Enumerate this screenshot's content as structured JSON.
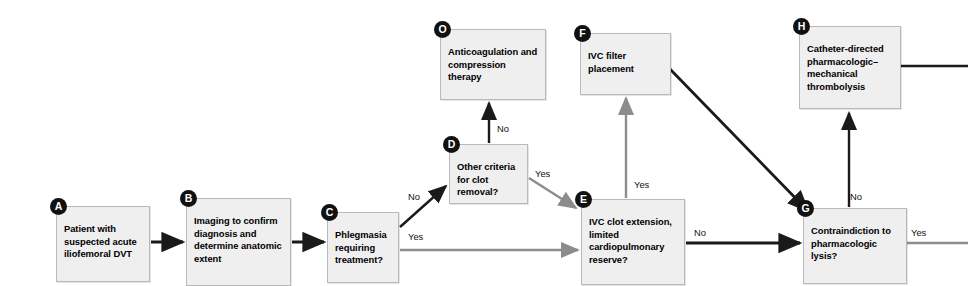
{
  "diagram": {
    "box_fill": "#efefef",
    "box_border": "#b9b9b9",
    "badge_fill": "#111111",
    "primary_edge_color": "#1a1a1a",
    "secondary_edge_color": "#8c8c8c",
    "nodes": [
      {
        "id": "A",
        "badge": "A",
        "text": "Patient with suspected acute iliofemoral DVT",
        "x": 56,
        "y": 206,
        "w": 94,
        "h": 76
      },
      {
        "id": "B",
        "badge": "B",
        "text": "Imaging to confirm diagnosis and determine anatomic extent",
        "x": 186,
        "y": 198,
        "w": 105,
        "h": 88
      },
      {
        "id": "C",
        "badge": "C",
        "text": "Phlegmasia requiring treatment?",
        "x": 327,
        "y": 212,
        "w": 72,
        "h": 71
      },
      {
        "id": "D",
        "badge": "D",
        "text": "Other criteria for clot removal?",
        "x": 449,
        "y": 144,
        "w": 79,
        "h": 60
      },
      {
        "id": "O",
        "badge": "O",
        "text": "Anticoagulation and compression therapy",
        "x": 440,
        "y": 29,
        "w": 106,
        "h": 71
      },
      {
        "id": "E",
        "badge": "E",
        "text": "IVC clot extension, limited cardiopulmonary reserve?",
        "x": 581,
        "y": 199,
        "w": 104,
        "h": 86
      },
      {
        "id": "F",
        "badge": "F",
        "text": "IVC filter placement",
        "x": 580,
        "y": 33,
        "w": 91,
        "h": 62
      },
      {
        "id": "G",
        "badge": "G",
        "text": "Contraindiction to pharmacologic lysis?",
        "x": 803,
        "y": 208,
        "w": 104,
        "h": 76
      },
      {
        "id": "H",
        "badge": "H",
        "text": "Catheter-directed pharmacologic–mechanical thrombolysis",
        "x": 799,
        "y": 26,
        "w": 102,
        "h": 83
      }
    ],
    "edge_labels": [
      {
        "id": "c-no",
        "text": "No",
        "x": 408,
        "y": 192
      },
      {
        "id": "c-yes",
        "text": "Yes",
        "x": 408,
        "y": 232
      },
      {
        "id": "d-no",
        "text": "No",
        "x": 497,
        "y": 124
      },
      {
        "id": "d-yes",
        "text": "Yes",
        "x": 535,
        "y": 169
      },
      {
        "id": "e-yes",
        "text": "Yes",
        "x": 634,
        "y": 180
      },
      {
        "id": "e-no",
        "text": "No",
        "x": 694,
        "y": 228
      },
      {
        "id": "g-no",
        "text": "No",
        "x": 850,
        "y": 192
      },
      {
        "id": "g-yes",
        "text": "Yes",
        "x": 911,
        "y": 228
      }
    ]
  }
}
